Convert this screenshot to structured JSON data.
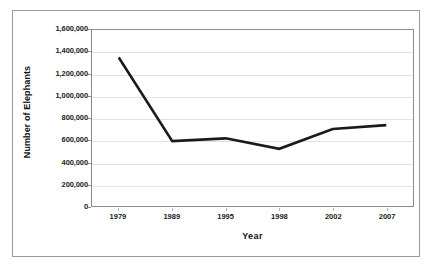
{
  "chart_data": {
    "type": "line",
    "title": "",
    "xlabel": "Year",
    "ylabel": "Number of Elephants",
    "categories": [
      "1979",
      "1989",
      "1995",
      "1998",
      "2002",
      "2007"
    ],
    "values": [
      1350000,
      590000,
      615000,
      520000,
      700000,
      735000
    ],
    "series": [
      {
        "name": "Number of Elephants",
        "values": [
          1350000,
          590000,
          615000,
          520000,
          700000,
          735000
        ]
      }
    ],
    "ylim": [
      0,
      1600000
    ],
    "ytick_values": [
      0,
      200000,
      400000,
      600000,
      800000,
      1000000,
      1200000,
      1400000,
      1600000
    ],
    "ytick_labels": [
      "0",
      "200,000",
      "400,000",
      "600,000",
      "800,000",
      "1,000,000",
      "1,200,000",
      "1,400,000",
      "1,600,000"
    ],
    "grid": true,
    "legend": false,
    "legend_position": "none",
    "line_color": "#1a1a1a",
    "grid_color": "#e2e2e2",
    "axis_color": "#8a8a8a",
    "background_color": "#ffffff",
    "border_color": "#9b9b9b"
  }
}
